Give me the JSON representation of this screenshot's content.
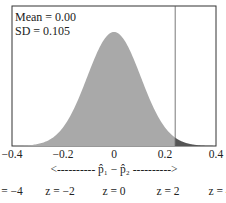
{
  "chart_data": {
    "type": "area",
    "title": "",
    "distribution": "normal",
    "mean": 0.0,
    "sd": 0.105,
    "annotations": {
      "mean_label": "Mean = 0.00",
      "sd_label": "SD = 0.105"
    },
    "xlabel": "<---------- p̂1 − p̂2 ---------->",
    "xlim": [
      -0.4,
      0.4
    ],
    "x_ticks": [
      "-0.4",
      "-0.2",
      "0",
      "0.2",
      "0.4"
    ],
    "z_ticks": [
      "z = −4",
      "z = −2",
      "z = 0",
      "z = 2",
      "z = 4"
    ],
    "cutoff": 0.24,
    "shaded_regions": [
      {
        "from": -0.4,
        "to": 0.24,
        "color": "#a9a9a9"
      },
      {
        "from": 0.24,
        "to": 0.4,
        "color": "#555555"
      }
    ],
    "grid": false,
    "legend": "none"
  },
  "labels": {
    "mean": "Mean = 0.00",
    "sd": "SD = 0.105",
    "xaxis": "<---------- p̂₁ − p̂₂ ---------->",
    "ticks": [
      "−0.4",
      "−0.2",
      "0",
      "0.2",
      "0.4"
    ],
    "z": [
      "z = −4",
      "z = −2",
      "z = 0",
      "z = 2",
      "z = 4"
    ]
  },
  "colors": {
    "body_fill": "#a9a9a9",
    "tail_fill": "#555555",
    "frame": "#333333"
  }
}
